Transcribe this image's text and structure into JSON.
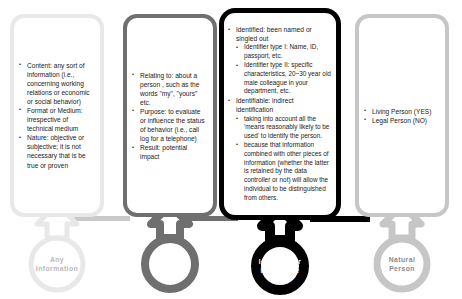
{
  "diagram": {
    "columns": [
      {
        "key": "any-information",
        "ring_label_line1": "Any",
        "ring_label_line2": "Information",
        "color": "#e8e8e8",
        "text_color": "#b8b8b8",
        "items": [
          {
            "text": "Content: any sort of information (i.e., concerning working relations or economic or social behavior)"
          },
          {
            "text": "Format or Medium: irrespective of technical medium"
          },
          {
            "text": "Nature: objective or subjective; it is not necessary that is be true or proven"
          }
        ]
      },
      {
        "key": "relating-to",
        "ring_label_line1": "Relating to",
        "ring_label_line2": "",
        "color": "#6f6f6f",
        "text_color": "#ffffff",
        "items": [
          {
            "text": "Relating to: about a person , such as the words \"my\", \"yours\" etc."
          },
          {
            "text": "Purpose: to evaluate or influence the status of behavior (i.e., call log for a telephone)"
          },
          {
            "text": "Result: potential impact"
          }
        ]
      },
      {
        "key": "identified-or-identifiable",
        "ring_label_line1": "Identified or",
        "ring_label_line2": "Identifiable",
        "color": "#000000",
        "text_color": "#ffffff",
        "items": [
          {
            "text": "Identified: been named or singled out",
            "sub": [
              "Identifier type I: Name, ID, passport, etc.",
              "Identifier type II: specific characteristics, 20~30 year old male colleague in your department, etc."
            ]
          },
          {
            "text": "Identifiable: indirect identification",
            "sub": [
              "taking into account all the 'means reasonably likely to be used' to identify the person.",
              "because that information combined with other pieces of information (whether the latter is retained by the data controller or not) will allow the individual to be distinguished from others."
            ]
          }
        ]
      },
      {
        "key": "natural-person",
        "ring_label_line1": "Natural",
        "ring_label_line2": "Person",
        "color": "#c6c6c6",
        "text_color": "#8a8a8a",
        "items": [
          {
            "text": "Living Person (YES)"
          },
          {
            "text": "Legal Person (NO)"
          }
        ]
      }
    ]
  }
}
